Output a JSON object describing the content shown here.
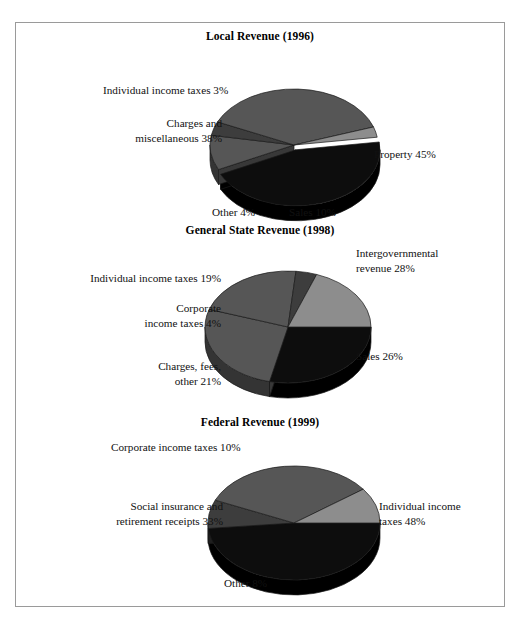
{
  "figure": {
    "border_color": "#9a9a9a",
    "background": "#ffffff"
  },
  "palette": {
    "black": "#0d0d0d",
    "dark_gray": "#3d3d3d",
    "mid_gray": "#565656",
    "light_gray": "#8d8d8d",
    "edge": "#1a1a1a",
    "side_black": "#080808",
    "side_dark": "#2a2a2a",
    "side_mid": "#3b3b3b",
    "side_light": "#616161"
  },
  "charts": [
    {
      "id": "local-revenue-1996",
      "title": "Local Revenue (1996)",
      "labels": [
        {
          "name": "property",
          "text": "Property 45%",
          "align": "left",
          "x": 358,
          "y": 124
        },
        {
          "name": "sales",
          "text": "Sales 10%",
          "align": "left",
          "x": 273,
          "y": 182
        },
        {
          "name": "other",
          "text": "Other 4%",
          "align": "left",
          "x": 196,
          "y": 182
        },
        {
          "name": "charges-misc",
          "text": "Charges and\nmiscellaneous 38%",
          "align": "right",
          "x": 43,
          "y": 93,
          "w": 163
        },
        {
          "name": "individual-income",
          "text": "Individual income taxes 3%",
          "align": "left",
          "x": 87,
          "y": 60
        }
      ]
    },
    {
      "id": "general-state-revenue-1998",
      "title": "General State Revenue (1998)",
      "labels": [
        {
          "name": "intergovernmental",
          "text": "Intergovernmental\nrevenue 28%",
          "align": "left",
          "x": 340,
          "y": 27
        },
        {
          "name": "sales",
          "text": "Sales 26%",
          "align": "left",
          "x": 340,
          "y": 130
        },
        {
          "name": "charges-fees-other",
          "text": "Charges, fees,\nother 21%",
          "align": "right",
          "x": 60,
          "y": 140,
          "w": 145
        },
        {
          "name": "corporate-income",
          "text": "Corporate\nincome taxes 4%",
          "align": "right",
          "x": 50,
          "y": 82,
          "w": 155
        },
        {
          "name": "individual-income",
          "text": "Individual income taxes 19%",
          "align": "right",
          "x": 25,
          "y": 52,
          "w": 180
        }
      ]
    },
    {
      "id": "federal-revenue-1999",
      "title": "Federal Revenue (1999)",
      "labels": [
        {
          "name": "individual-income",
          "text": "Individual income\ntaxes 48%",
          "align": "left",
          "x": 363,
          "y": 88
        },
        {
          "name": "social-insurance",
          "text": "Social insurance and\nretirement receipts 33%",
          "align": "right",
          "x": 25,
          "y": 88,
          "w": 182
        },
        {
          "name": "corporate-income",
          "text": "Corporate income taxes 10%",
          "align": "left",
          "x": 95,
          "y": 29
        },
        {
          "name": "other",
          "text": "Other 8%",
          "align": "left",
          "x": 208,
          "y": 165
        }
      ]
    }
  ],
  "chart_data": [
    {
      "type": "pie",
      "title": "Local Revenue (1996)",
      "categories": [
        "Property",
        "Sales",
        "Other",
        "Charges and miscellaneous",
        "Individual income taxes"
      ],
      "values": [
        45,
        10,
        4,
        38,
        3
      ],
      "value_unit": "percent",
      "legend": "none",
      "labels_inline": true,
      "colors": [
        "#0d0d0d",
        "#565656",
        "#3d3d3d",
        "#565656",
        "#8d8d8d"
      ],
      "start_angle_deg": -8,
      "direction": "clockwise",
      "three_d": true,
      "exploded_slices": [
        "Property"
      ]
    },
    {
      "type": "pie",
      "title": "General State Revenue (1998)",
      "categories": [
        "Intergovernmental revenue",
        "Sales",
        "Charges, fees, other",
        "Corporate income taxes",
        "Individual income taxes"
      ],
      "values": [
        28,
        26,
        21,
        4,
        19
      ],
      "value_unit": "percent",
      "legend": "none",
      "labels_inline": true,
      "colors": [
        "#0d0d0d",
        "#565656",
        "#565656",
        "#3d3d3d",
        "#8d8d8d"
      ],
      "start_angle_deg": 0,
      "direction": "clockwise",
      "three_d": true,
      "exploded_slices": []
    },
    {
      "type": "pie",
      "title": "Federal Revenue (1999)",
      "categories": [
        "Individual income taxes",
        "Other",
        "Social insurance and retirement receipts",
        "Corporate income taxes"
      ],
      "values": [
        48,
        8,
        33,
        10
      ],
      "value_unit": "percent",
      "legend": "none",
      "labels_inline": true,
      "colors": [
        "#0d0d0d",
        "#3d3d3d",
        "#565656",
        "#8d8d8d"
      ],
      "start_angle_deg": 0,
      "direction": "clockwise",
      "three_d": true,
      "exploded_slices": []
    }
  ],
  "pie_geometry": [
    {
      "cx": 278,
      "cy": 122,
      "rx": 84,
      "ry": 56,
      "depth": 15
    },
    {
      "cx": 272,
      "cy": 108,
      "rx": 83,
      "ry": 56,
      "depth": 15
    },
    {
      "cx": 278,
      "cy": 112,
      "rx": 86,
      "ry": 57,
      "depth": 15
    }
  ]
}
